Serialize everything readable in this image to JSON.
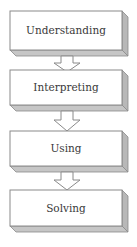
{
  "diagram": {
    "type": "vertical-flowchart",
    "steps": [
      {
        "label": "Understanding"
      },
      {
        "label": "Interpreting"
      },
      {
        "label": "Using"
      },
      {
        "label": "Solving"
      }
    ],
    "arrows": [
      {
        "from": "Understanding",
        "to": "Interpreting"
      },
      {
        "from": "Interpreting",
        "to": "Using"
      },
      {
        "from": "Using",
        "to": "Solving"
      }
    ],
    "colors": {
      "box_fill": "#ffffff",
      "box_stroke": "#8a8a8a",
      "side_shade": "#b8b8b8",
      "bottom_shade": "#c6c6c6",
      "arrow_fill": "#ffffff",
      "arrow_stroke": "#8a8a8a",
      "text": "#3a3a3a"
    }
  }
}
